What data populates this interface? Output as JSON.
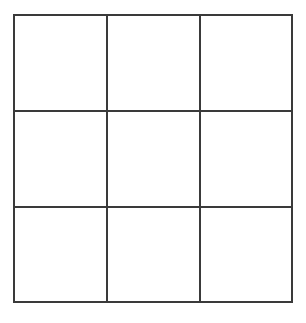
{
  "diagram": {
    "type": "grid",
    "rows": 3,
    "columns": 3,
    "line_color": "#3a3a3a",
    "background_color": "#ffffff",
    "cells": [
      [
        "",
        "",
        ""
      ],
      [
        "",
        "",
        ""
      ],
      [
        "",
        "",
        ""
      ]
    ]
  }
}
